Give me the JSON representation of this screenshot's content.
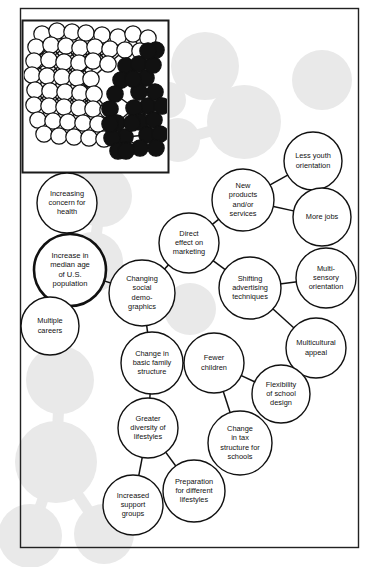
{
  "diagram": {
    "frame_color": "#222222",
    "node_fill": "#ffffff",
    "node_stroke": "#111111",
    "ghost_color": "#e9e9e9",
    "center_node_stroke_width": 2.6
  },
  "inset": {
    "name": "network-cluster-inset",
    "white_node_color": "#ffffff",
    "black_node_color": "#111111",
    "edge_color": "#111111",
    "border_color": "#1a1a1a",
    "white_nodes": [
      [
        20,
        14
      ],
      [
        35,
        11
      ],
      [
        50,
        12
      ],
      [
        64,
        13
      ],
      [
        80,
        15
      ],
      [
        96,
        17
      ],
      [
        111,
        14
      ],
      [
        126,
        18
      ],
      [
        14,
        27
      ],
      [
        29,
        25
      ],
      [
        44,
        26
      ],
      [
        58,
        28
      ],
      [
        73,
        27
      ],
      [
        88,
        29
      ],
      [
        103,
        30
      ],
      [
        118,
        31
      ],
      [
        12,
        41
      ],
      [
        27,
        40
      ],
      [
        42,
        42
      ],
      [
        57,
        43
      ],
      [
        71,
        41
      ],
      [
        86,
        44
      ],
      [
        10,
        55
      ],
      [
        25,
        56
      ],
      [
        40,
        57
      ],
      [
        55,
        58
      ],
      [
        69,
        59
      ],
      [
        13,
        70
      ],
      [
        28,
        71
      ],
      [
        43,
        72
      ],
      [
        58,
        73
      ],
      [
        72,
        74
      ],
      [
        12,
        85
      ],
      [
        27,
        86
      ],
      [
        42,
        87
      ],
      [
        57,
        88
      ],
      [
        71,
        89
      ],
      [
        86,
        90
      ],
      [
        16,
        100
      ],
      [
        31,
        101
      ],
      [
        46,
        102
      ],
      [
        61,
        103
      ],
      [
        76,
        104
      ],
      [
        22,
        114
      ],
      [
        37,
        116
      ],
      [
        52,
        117
      ],
      [
        67,
        118
      ],
      [
        82,
        119
      ],
      [
        97,
        120
      ]
    ],
    "black_nodes": [
      [
        104,
        46
      ],
      [
        99,
        60
      ],
      [
        93,
        74
      ],
      [
        88,
        89
      ],
      [
        95,
        103
      ],
      [
        103,
        117
      ],
      [
        117,
        44
      ],
      [
        124,
        58
      ],
      [
        131,
        45
      ],
      [
        117,
        72
      ],
      [
        126,
        86
      ],
      [
        133,
        72
      ],
      [
        112,
        88
      ],
      [
        118,
        102
      ],
      [
        110,
        103
      ],
      [
        125,
        115
      ],
      [
        118,
        128
      ],
      [
        104,
        130
      ],
      [
        132,
        100
      ],
      [
        138,
        114
      ],
      [
        134,
        30
      ],
      [
        126,
        31
      ],
      [
        90,
        118
      ],
      [
        96,
        131
      ],
      [
        111,
        59
      ],
      [
        104,
        131
      ],
      [
        88,
        104
      ],
      [
        140,
        86
      ],
      [
        134,
        128
      ]
    ]
  },
  "nodes": [
    {
      "id": "increasing-concern-health",
      "label": "Increasing\nconcern for\nhealth",
      "cx": 67,
      "cy": 203,
      "r": 30,
      "emphasis": false
    },
    {
      "id": "increase-median-age",
      "label": "Increase in\nmedian age\nof U.S.\npopulation",
      "cx": 70,
      "cy": 270,
      "r": 36,
      "emphasis": true
    },
    {
      "id": "multiple-careers",
      "label": "Multiple\ncareers",
      "cx": 50,
      "cy": 326,
      "r": 29,
      "emphasis": false
    },
    {
      "id": "changing-social-demographics",
      "label": "Changing\nsocial\ndemo-\ngraphics",
      "cx": 142,
      "cy": 293,
      "r": 33,
      "emphasis": false
    },
    {
      "id": "direct-effect-marketing",
      "label": "Direct\neffect on\nmarketing",
      "cx": 189,
      "cy": 243,
      "r": 30,
      "emphasis": false
    },
    {
      "id": "new-products-services",
      "label": "New\nproducts\nand/or\nservices",
      "cx": 243,
      "cy": 200,
      "r": 31,
      "emphasis": false
    },
    {
      "id": "less-youth-orientation",
      "label": "Less youth\norientation",
      "cx": 313,
      "cy": 161,
      "r": 29,
      "emphasis": false
    },
    {
      "id": "more-jobs",
      "label": "More jobs",
      "cx": 322,
      "cy": 217,
      "r": 29,
      "emphasis": false
    },
    {
      "id": "shifting-advertising-techniques",
      "label": "Shifting\nadvertising\ntechniques",
      "cx": 250,
      "cy": 288,
      "r": 31,
      "emphasis": false
    },
    {
      "id": "multi-sensory-orientation",
      "label": "Multi-\nsensory\norientation",
      "cx": 326,
      "cy": 278,
      "r": 30,
      "emphasis": false
    },
    {
      "id": "multicultural-appeal",
      "label": "Multicultural\nappeal",
      "cx": 316,
      "cy": 348,
      "r": 30,
      "emphasis": false
    },
    {
      "id": "change-basic-family-structure",
      "label": "Change in\nbasic family\nstructure",
      "cx": 152,
      "cy": 363,
      "r": 31,
      "emphasis": false
    },
    {
      "id": "fewer-children",
      "label": "Fewer\nchildren",
      "cx": 214,
      "cy": 363,
      "r": 30,
      "emphasis": false
    },
    {
      "id": "flexibility-school-design",
      "label": "Flexibility\nof school\ndesign",
      "cx": 281,
      "cy": 394,
      "r": 29,
      "emphasis": false
    },
    {
      "id": "change-tax-structure-schools",
      "label": "Change\nin tax\nstructure for\nschools",
      "cx": 240,
      "cy": 443,
      "r": 32,
      "emphasis": false
    },
    {
      "id": "greater-diversity-lifestyles",
      "label": "Greater\ndiversity of\nlifestyles",
      "cx": 148,
      "cy": 428,
      "r": 30,
      "emphasis": false
    },
    {
      "id": "preparation-different-lifestyles",
      "label": "Preparation\nfor different\nlifestyles",
      "cx": 194,
      "cy": 491,
      "r": 31,
      "emphasis": false
    },
    {
      "id": "increased-support-groups",
      "label": "Increased\nsupport\ngroups",
      "cx": 133,
      "cy": 505,
      "r": 30,
      "emphasis": false
    }
  ],
  "edges": [
    {
      "from": "increase-median-age",
      "to": "increasing-concern-health"
    },
    {
      "from": "increase-median-age",
      "to": "multiple-careers"
    },
    {
      "from": "increase-median-age",
      "to": "changing-social-demographics"
    },
    {
      "from": "changing-social-demographics",
      "to": "direct-effect-marketing"
    },
    {
      "from": "changing-social-demographics",
      "to": "change-basic-family-structure"
    },
    {
      "from": "direct-effect-marketing",
      "to": "new-products-services"
    },
    {
      "from": "direct-effect-marketing",
      "to": "shifting-advertising-techniques"
    },
    {
      "from": "new-products-services",
      "to": "less-youth-orientation"
    },
    {
      "from": "new-products-services",
      "to": "more-jobs"
    },
    {
      "from": "shifting-advertising-techniques",
      "to": "multi-sensory-orientation"
    },
    {
      "from": "shifting-advertising-techniques",
      "to": "multicultural-appeal"
    },
    {
      "from": "change-basic-family-structure",
      "to": "fewer-children"
    },
    {
      "from": "change-basic-family-structure",
      "to": "greater-diversity-lifestyles"
    },
    {
      "from": "fewer-children",
      "to": "flexibility-school-design"
    },
    {
      "from": "fewer-children",
      "to": "change-tax-structure-schools"
    },
    {
      "from": "greater-diversity-lifestyles",
      "to": "increased-support-groups"
    },
    {
      "from": "greater-diversity-lifestyles",
      "to": "preparation-different-lifestyles"
    }
  ],
  "ghosts": [
    {
      "cx": 101,
      "cy": 196,
      "r": 31
    },
    {
      "cx": 93,
      "cy": 262,
      "r": 30
    },
    {
      "cx": 60,
      "cy": 380,
      "r": 34
    },
    {
      "cx": 56,
      "cy": 462,
      "r": 41
    },
    {
      "cx": 30,
      "cy": 536,
      "r": 32
    },
    {
      "cx": 104,
      "cy": 534,
      "r": 30
    },
    {
      "cx": 205,
      "cy": 66,
      "r": 34
    },
    {
      "cx": 244,
      "cy": 122,
      "r": 37
    },
    {
      "cx": 178,
      "cy": 140,
      "r": 22
    },
    {
      "cx": 168,
      "cy": 100,
      "r": 18
    },
    {
      "cx": 190,
      "cy": 309,
      "r": 26
    },
    {
      "cx": 322,
      "cy": 80,
      "r": 30
    }
  ],
  "ghost_edges": [
    {
      "x1": 101,
      "y1": 196,
      "x2": 93,
      "y2": 262
    },
    {
      "x1": 60,
      "y1": 380,
      "x2": 56,
      "y2": 462
    },
    {
      "x1": 56,
      "y1": 462,
      "x2": 30,
      "y2": 536
    },
    {
      "x1": 56,
      "y1": 462,
      "x2": 104,
      "y2": 534
    },
    {
      "x1": 205,
      "y1": 66,
      "x2": 244,
      "y2": 122
    },
    {
      "x1": 178,
      "y1": 140,
      "x2": 244,
      "y2": 122
    },
    {
      "x1": 168,
      "y1": 100,
      "x2": 205,
      "y2": 66
    }
  ]
}
